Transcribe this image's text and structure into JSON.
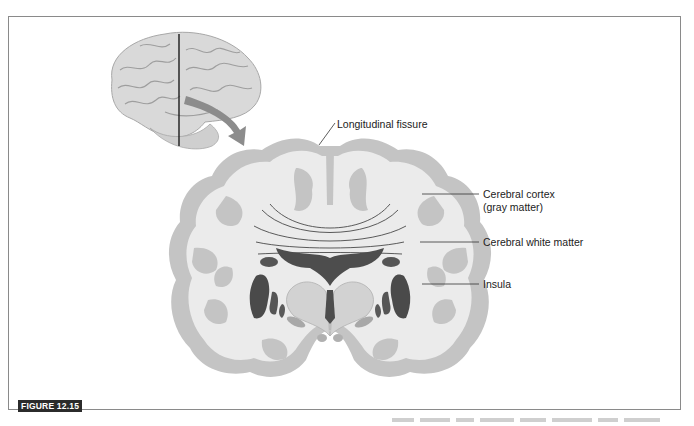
{
  "figure": {
    "tag": "FIGURE 12.15"
  },
  "labels": {
    "longitudinal_fissure": "Longitudinal fissure",
    "cerebral_cortex_line1": "Cerebral cortex",
    "cerebral_cortex_line2": "(gray matter)",
    "cerebral_white_matter": "Cerebral white matter",
    "insula": "Insula"
  },
  "colors": {
    "cortex_gray": "#c4c4c4",
    "white_matter": "#ebebeb",
    "dark_nuclei": "#555555",
    "thalamus": "#d6d6d6",
    "arrow": "#8c8c8c",
    "frame": "#8a8a8a",
    "tag_bg": "#2b2b2b"
  }
}
